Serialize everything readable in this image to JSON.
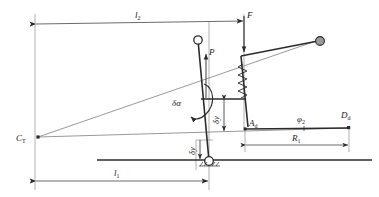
{
  "figure": {
    "type": "engineering-kinematic-diagram",
    "background_color": "#ffffff",
    "line_color": "#2b2b2b",
    "thin_line_color": "#555555",
    "node_fill_open": "#ffffff",
    "node_fill_solid": "#9a9a9a",
    "width": 379,
    "height": 197
  },
  "labels": {
    "l2": "l",
    "l2_sub": "2",
    "l1": "l",
    "l1_sub": "1",
    "R1": "R",
    "R1_sub": "1",
    "force_F": "F",
    "force_P": "P",
    "angle_delta_alpha": "δα",
    "disp_delta_y_upper": "δy",
    "disp_delta_y_lower": "δy",
    "pivot_CT": "C",
    "pivot_CT_sub": "T",
    "point_Ad": "A",
    "point_Ad_sub": "d",
    "point_Dd": "D",
    "point_Dd_sub": "d",
    "angle_phi2": "φ",
    "angle_phi2_sub": "2"
  },
  "elements": {
    "instant_centre": "C_T",
    "top_pivot_node": "open-circle",
    "right_arm_node": "filled-circle",
    "ground_support": "pinned-hinge-with-hatching",
    "spring": "coil-spring",
    "ground_line": "thick-horizontal-line"
  },
  "dimensions": [
    {
      "name": "l2",
      "label": "l₂",
      "orientation": "horizontal",
      "position": "top"
    },
    {
      "name": "l1",
      "label": "l₁",
      "orientation": "horizontal",
      "position": "bottom"
    },
    {
      "name": "R1",
      "label": "R₁",
      "orientation": "horizontal",
      "position": "lower-right"
    },
    {
      "name": "delta_y_upper",
      "label": "δy",
      "orientation": "vertical",
      "position": "centre"
    },
    {
      "name": "delta_y_lower",
      "label": "δy",
      "orientation": "vertical",
      "position": "lower-centre"
    }
  ],
  "forces": [
    {
      "name": "F",
      "label": "F",
      "direction": "down",
      "location": "top-right-vertical-member"
    },
    {
      "name": "P",
      "label": "P",
      "direction": "up",
      "location": "centre-mast"
    }
  ],
  "angles": [
    {
      "name": "delta_alpha",
      "label": "δα",
      "location": "centre-mast"
    },
    {
      "name": "phi2",
      "label": "φ₂",
      "location": "lower-right-arm"
    }
  ]
}
